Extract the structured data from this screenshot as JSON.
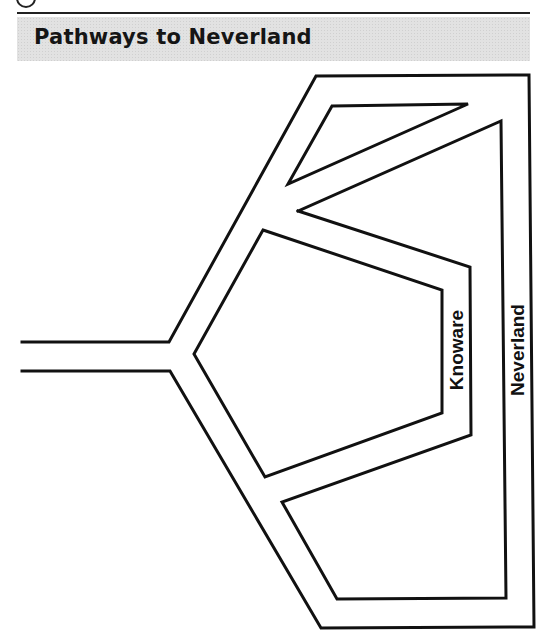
{
  "header": {
    "title": "Pathways to Neverland"
  },
  "diagram": {
    "labels": {
      "knoware": "Knoware",
      "neverland": "Neverland"
    },
    "stroke_color": "#111111",
    "title_bar_color": "#e2e2e2"
  }
}
